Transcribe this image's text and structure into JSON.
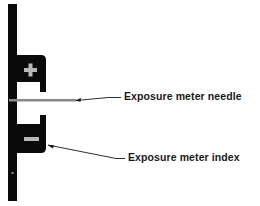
{
  "diagram": {
    "colors": {
      "body": "#0a0a0a",
      "symbol": "#b8b8b8",
      "needle": "#8a8a8a",
      "leader_line": "#1a1a1a",
      "background": "#ffffff"
    },
    "symbols": {
      "plus": "+",
      "minus": "−"
    },
    "callouts": [
      {
        "id": "needle",
        "label": "Exposure meter needle"
      },
      {
        "id": "index",
        "label": "Exposure meter index"
      }
    ]
  }
}
